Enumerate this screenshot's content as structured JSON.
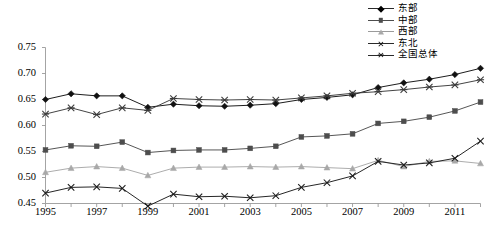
{
  "chart_data": {
    "type": "line",
    "title": "",
    "xlabel": "",
    "ylabel": "",
    "x": [
      1995,
      1996,
      1997,
      1998,
      1999,
      2000,
      2001,
      2002,
      2003,
      2004,
      2005,
      2006,
      2007,
      2008,
      2009,
      2010,
      2011,
      2012
    ],
    "xtick_labels": [
      "1995",
      "1997",
      "1999",
      "2001",
      "2003",
      "2005",
      "2007",
      "2009",
      "2011"
    ],
    "xtick_values": [
      1995,
      1997,
      1999,
      2001,
      2003,
      2005,
      2007,
      2009,
      2011
    ],
    "ytick_labels": [
      "0.45",
      "0.50",
      "0.55",
      "0.60",
      "0.65",
      "0.70",
      "0.75"
    ],
    "ytick_values": [
      0.45,
      0.5,
      0.55,
      0.6,
      0.65,
      0.7,
      0.75
    ],
    "ylim": [
      0.45,
      0.75
    ],
    "xlim": [
      1995,
      2012
    ],
    "grid": false,
    "legend_position": "top-right",
    "series": [
      {
        "name": "东部",
        "marker": "diamond",
        "color": "#111111",
        "values": [
          0.65,
          0.661,
          0.657,
          0.657,
          0.635,
          0.641,
          0.638,
          0.637,
          0.639,
          0.642,
          0.65,
          0.654,
          0.659,
          0.673,
          0.682,
          0.689,
          0.698,
          0.71
        ]
      },
      {
        "name": "中部",
        "marker": "square",
        "color": "#4d4d4d",
        "values": [
          0.553,
          0.561,
          0.56,
          0.568,
          0.548,
          0.552,
          0.553,
          0.553,
          0.556,
          0.56,
          0.578,
          0.58,
          0.584,
          0.604,
          0.608,
          0.616,
          0.628,
          0.645
        ]
      },
      {
        "name": "西部",
        "marker": "triangle",
        "color": "#a8a8a8",
        "values": [
          0.51,
          0.518,
          0.521,
          0.518,
          0.504,
          0.518,
          0.52,
          0.52,
          0.521,
          0.52,
          0.521,
          0.519,
          0.517,
          0.533,
          0.521,
          0.531,
          0.532,
          0.527
        ]
      },
      {
        "name": "东北",
        "marker": "x",
        "color": "#1a1a1a",
        "values": [
          0.47,
          0.481,
          0.482,
          0.479,
          0.445,
          0.468,
          0.463,
          0.464,
          0.461,
          0.465,
          0.481,
          0.49,
          0.503,
          0.531,
          0.524,
          0.528,
          0.537,
          0.57
        ]
      },
      {
        "name": "全国总体",
        "marker": "star",
        "color": "#3a3a3a",
        "values": [
          0.622,
          0.634,
          0.621,
          0.634,
          0.629,
          0.652,
          0.65,
          0.649,
          0.65,
          0.649,
          0.653,
          0.657,
          0.662,
          0.665,
          0.669,
          0.674,
          0.678,
          0.688
        ]
      }
    ]
  },
  "legend": {
    "items": [
      {
        "label": "东部"
      },
      {
        "label": "中部"
      },
      {
        "label": "西部"
      },
      {
        "label": "东北"
      },
      {
        "label": "全国总体"
      }
    ]
  }
}
